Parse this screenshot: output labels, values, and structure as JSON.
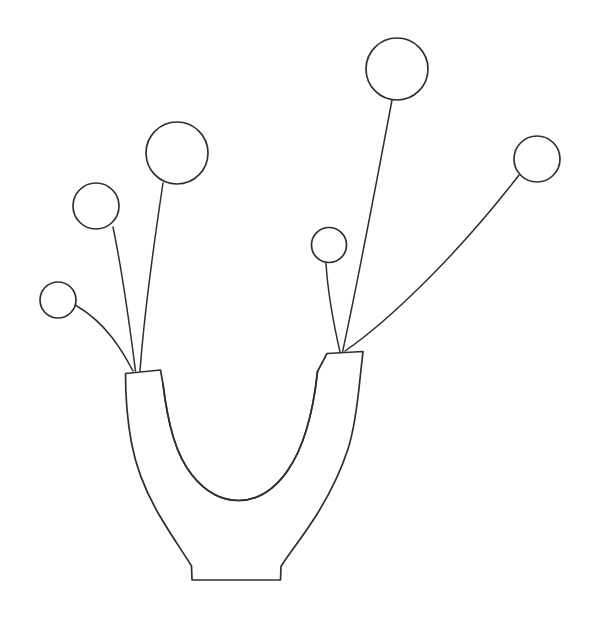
{
  "document": {
    "title": "Flower Vase Line Drawing",
    "kind": "line-art-illustration",
    "subject": "U-shaped vase holding six long-stemmed round blooms"
  },
  "canvas": {
    "width": 594,
    "height": 617,
    "background_color": "#ffffff",
    "stroke_color": "#2f2f33",
    "stroke_width": 1.6,
    "fill_color": "none"
  },
  "vase": {
    "name": "u-shaped-vase",
    "outline_path": "M 125.5 373.5 L 160.5 370.0 L 163.0 384.0 C 168.0 425.0 176.0 455.0 192.0 475.0 C 206.0 492.5 222.0 500.5 238.5 500.5 C 256.0 500.5 273.0 491.0 287.0 471.5 C 303.0 449.0 313.0 414.0 317.5 371.5 L 327.0 353.5 L 363.0 351.5 L 360.5 374.0 C 357.0 410.0 353.5 432.0 348.0 449.0 C 340.0 473.5 329.0 495.0 316.5 515.0 C 302.0 538.0 288.0 555.0 281.0 566.5 L 280.5 580.0 L 192.0 580.0 L 191.5 566.0 C 184.0 553.5 170.0 534.0 157.5 512.0 C 145.0 490.0 136.0 467.0 131.5 443.0 C 127.5 421.5 125.5 396.0 125.5 373.5 Z",
    "inner_curve_path": "M 163.0 384.0 C 168.0 425.0 176.0 455.0 192.0 475.0 C 206.0 492.5 222.0 500.5 238.5 500.5 C 256.0 500.5 273.0 491.0 287.0 471.5 C 303.0 449.0 313.0 414.0 317.5 371.5",
    "left_rim": {
      "name": "vase-left-rim",
      "path": "M 125.5 373.5 L 160.5 370.0",
      "x_left": 125.5,
      "x_right": 160.5,
      "y": 372
    },
    "right_rim": {
      "name": "vase-right-rim",
      "path": "M 327.0 353.5 L 363.0 351.5",
      "x_left": 327.0,
      "x_right": 363.0,
      "y": 352
    },
    "base": {
      "name": "vase-base",
      "path": "M 192.0 580.0 L 280.5 580.0",
      "x_left": 192,
      "x_right": 280.5,
      "y": 580
    }
  },
  "flowers": [
    {
      "id": "flower-1",
      "name": "flower-small-far-left",
      "bloom": {
        "cx": 58,
        "cy": 300,
        "r": 18
      },
      "stem_path": "M 133.0 371.0 C 122.0 350.0 106.0 323.0 76.0 305.5",
      "stem_origin": {
        "x": 133,
        "y": 371
      },
      "side": "left",
      "size_label": "small"
    },
    {
      "id": "flower-2",
      "name": "flower-medium-left",
      "bloom": {
        "cx": 96,
        "cy": 206,
        "r": 23
      },
      "stem_path": "M 135.5 371.0 C 131.0 336.0 124.0 280.0 113.0 227.0",
      "stem_origin": {
        "x": 135.5,
        "y": 371
      },
      "side": "left",
      "size_label": "medium"
    },
    {
      "id": "flower-3",
      "name": "flower-large-left",
      "bloom": {
        "cx": 177,
        "cy": 153,
        "r": 31
      },
      "stem_path": "M 140.0 371.0 C 143.0 330.0 152.0 256.0 163.0 183.0",
      "stem_origin": {
        "x": 140,
        "y": 371
      },
      "side": "left",
      "size_label": "large"
    },
    {
      "id": "flower-4",
      "name": "flower-small-center-right",
      "bloom": {
        "cx": 329,
        "cy": 245,
        "r": 17.5
      },
      "stem_path": "M 340.0 352.0 C 335.0 330.0 328.0 298.0 326.0 263.0",
      "stem_origin": {
        "x": 340,
        "y": 352
      },
      "side": "right",
      "size_label": "small"
    },
    {
      "id": "flower-5",
      "name": "flower-large-top-right",
      "bloom": {
        "cx": 397,
        "cy": 69,
        "r": 31
      },
      "stem_path": "M 342.5 352.0 C 355.0 295.0 376.0 185.0 392.0 100.0",
      "stem_origin": {
        "x": 342.5,
        "y": 352
      },
      "side": "right",
      "size_label": "large"
    },
    {
      "id": "flower-6",
      "name": "flower-medium-far-right",
      "bloom": {
        "cx": 537,
        "cy": 159,
        "r": 23
      },
      "stem_path": "M 345.0 351.0 C 390.0 320.0 460.0 252.0 519.0 175.0",
      "stem_origin": {
        "x": 345,
        "y": 351
      },
      "side": "right",
      "size_label": "medium"
    }
  ],
  "counts": {
    "flowers": 6,
    "left_side_stems": 3,
    "right_side_stems": 3
  }
}
